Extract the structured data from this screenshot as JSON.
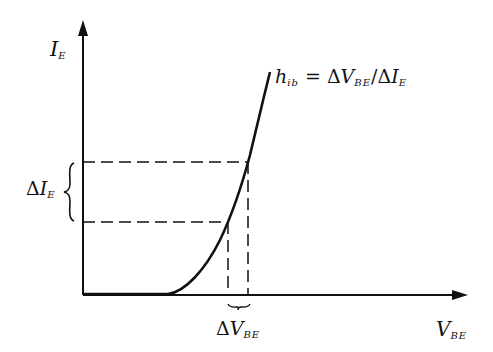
{
  "diagram": {
    "type": "transistor input characteristic",
    "y_axis": {
      "label_main": "I",
      "label_sub": "E"
    },
    "x_axis": {
      "label_main": "V",
      "label_sub": "BE"
    },
    "curve_label": {
      "lhs_main": "h",
      "lhs_sub": "ib",
      "equals": "=",
      "delta1": "Δ",
      "num_main": "V",
      "num_sub": "BE",
      "slash": "/",
      "delta2": "Δ",
      "den_main": "I",
      "den_sub": "E"
    },
    "delta_ie_label": {
      "delta": "Δ",
      "main": "I",
      "sub": "E"
    },
    "delta_vbe_label": {
      "delta": "Δ",
      "main": "V",
      "sub": "BE"
    },
    "colors": {
      "ink": "#111111",
      "background": "#ffffff"
    }
  }
}
